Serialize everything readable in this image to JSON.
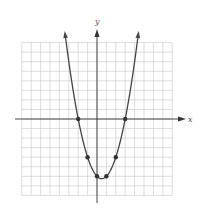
{
  "chart_data": {
    "type": "line",
    "title": "",
    "xlabel": "x",
    "ylabel": "y",
    "xlim": [
      -8,
      8
    ],
    "ylim": [
      -8,
      8
    ],
    "grid": true,
    "grid_step": 1,
    "function": "y = x^2 - x - 6",
    "series": [
      {
        "name": "parabola",
        "x": [
          -3.27,
          -2,
          -1,
          0,
          0.5,
          1,
          2,
          3,
          4.27
        ],
        "y": [
          8,
          0,
          -4,
          -6,
          -6.25,
          -6,
          -4,
          0,
          8
        ]
      }
    ],
    "points": [
      {
        "x": -2,
        "y": 0
      },
      {
        "x": 3,
        "y": 0
      },
      {
        "x": -1,
        "y": -4
      },
      {
        "x": 2,
        "y": -4
      },
      {
        "x": 0,
        "y": -6
      },
      {
        "x": 1,
        "y": -6
      }
    ],
    "legend": null
  },
  "labels": {
    "x_axis": "x",
    "y_axis": "y"
  },
  "colors": {
    "grid": "#c8c8c8",
    "axis": "#333333",
    "curve": "#444444",
    "point": "#333333"
  }
}
